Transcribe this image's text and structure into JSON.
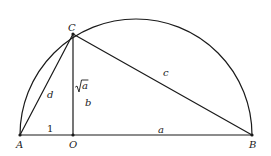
{
  "diagram": {
    "type": "geometry-semicircle-construction",
    "points": {
      "A": {
        "label": "A",
        "x": 20,
        "y": 135
      },
      "O": {
        "label": "O",
        "x": 73,
        "y": 135
      },
      "B": {
        "label": "B",
        "x": 252,
        "y": 135
      },
      "C": {
        "label": "C",
        "x": 73,
        "y": 34
      }
    },
    "segment_labels": {
      "AO": "1",
      "OB": "a",
      "AC": "d",
      "CB": "c",
      "CO_value": "√a",
      "CO_name": "b"
    },
    "sqrt_symbol": "√",
    "sqrt_arg": "a"
  }
}
